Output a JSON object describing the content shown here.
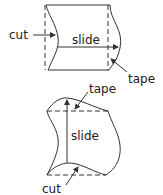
{
  "diagram": {
    "top_figure": {
      "labels": {
        "cut": "cut",
        "slide": "slide",
        "tape": "tape"
      }
    },
    "bottom_figure": {
      "labels": {
        "tape": "tape",
        "slide": "slide",
        "cut": "cut"
      }
    },
    "colors": {
      "stroke": "#333333",
      "text": "#222222",
      "background": "#ffffff"
    }
  }
}
